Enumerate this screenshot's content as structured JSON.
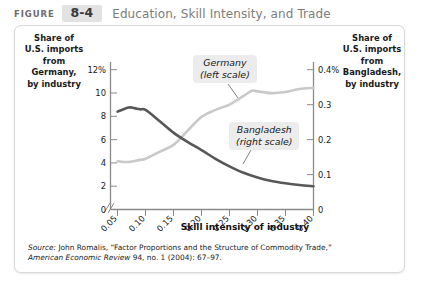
{
  "header": {
    "figure_word": "FIGURE",
    "figure_number": "8-4",
    "title": "Education, Skill Intensity, and Trade"
  },
  "axis_captions": {
    "left": "Share of\nU.S. imports\nfrom\nGermany,\nby industry",
    "right": "Share of\nU.S. imports\nfrom\nBangladesh,\nby industry"
  },
  "legend": {
    "germany": "Germany\n(left scale)",
    "bangladesh": "Bangladesh\n(right scale)"
  },
  "source": {
    "line1_prefix": "Source:",
    "line1": " John Romalis, “Factor Proportions and the Structure of Commodity Trade,”",
    "line2_italic": "American Economic Review",
    "line2_rest": " 94, no. 1 (2004): 67–97."
  },
  "colors": {
    "germany_line": "#575757",
    "bangladesh_line": "#c9c9c9",
    "axis": "#8a8a8a",
    "legend_bg": "#ececec",
    "header_badge_bg": "#e2e2e2",
    "header_title": "#7c7c7c"
  },
  "chart_data": {
    "type": "line",
    "title": "Education, Skill Intensity, and Trade",
    "xlabel": "Skill intensity of industry",
    "xticks": [
      "0.05",
      "0.10",
      "0.15",
      "0.20",
      "0.25",
      "0.30",
      "0.35",
      "0.40"
    ],
    "x": [
      0.05,
      0.1,
      0.15,
      0.2,
      0.25,
      0.3,
      0.35,
      0.4
    ],
    "xlim": [
      0.05,
      0.4
    ],
    "x_axis_break": true,
    "x_origin_label": "0",
    "grid": false,
    "legend_position": "inside",
    "axes": [
      {
        "id": "left",
        "label": "Share of U.S. imports from Germany, by industry",
        "ticks": [
          "0",
          "2",
          "4",
          "6",
          "8",
          "10",
          "12%"
        ],
        "tick_values": [
          0,
          2,
          4,
          6,
          8,
          10,
          12
        ],
        "ylim": [
          0,
          12
        ],
        "unit": "%"
      },
      {
        "id": "right",
        "label": "Share of U.S. imports from Bangladesh, by industry",
        "ticks": [
          "0",
          "0.1",
          "0.2",
          "0.3",
          "0.4%"
        ],
        "tick_values": [
          0,
          0.1,
          0.2,
          0.3,
          0.4
        ],
        "ylim": [
          0,
          0.4
        ],
        "unit": "%"
      }
    ],
    "series": [
      {
        "name": "Germany",
        "axis": "left",
        "color": "#575757",
        "x": [
          0.05,
          0.07,
          0.08,
          0.09,
          0.1,
          0.125,
          0.15,
          0.175,
          0.2,
          0.225,
          0.25,
          0.275,
          0.3,
          0.325,
          0.35,
          0.375,
          0.4
        ],
        "values": [
          8.4,
          8.75,
          8.7,
          8.6,
          8.55,
          7.6,
          6.6,
          5.8,
          5.1,
          4.35,
          3.7,
          3.15,
          2.75,
          2.45,
          2.25,
          2.1,
          2.0
        ]
      },
      {
        "name": "Bangladesh",
        "axis": "right",
        "color": "#c9c9c9",
        "x": [
          0.05,
          0.07,
          0.09,
          0.1,
          0.125,
          0.15,
          0.175,
          0.2,
          0.225,
          0.25,
          0.275,
          0.29,
          0.3,
          0.325,
          0.35,
          0.375,
          0.4
        ],
        "values": [
          0.138,
          0.136,
          0.142,
          0.145,
          0.165,
          0.185,
          0.225,
          0.265,
          0.285,
          0.3,
          0.325,
          0.34,
          0.338,
          0.333,
          0.336,
          0.345,
          0.348
        ]
      }
    ]
  }
}
